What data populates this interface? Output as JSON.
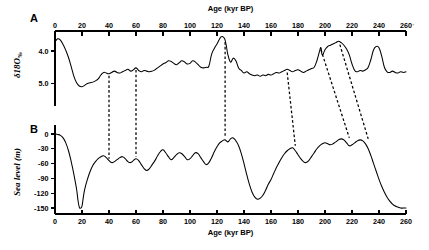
{
  "figure": {
    "panels": [
      {
        "id": "A",
        "label": "A"
      },
      {
        "id": "B",
        "label": "B"
      }
    ]
  },
  "chart_data": [
    {
      "type": "line",
      "panel": "A",
      "title": "",
      "xlabel": "Age (kyr BP)",
      "ylabel": "δ18O‰",
      "ylabel_main": "δ18O",
      "ylabel_unit": "‰",
      "xlim": [
        0,
        260
      ],
      "ylim": [
        5.45,
        3.35
      ],
      "y_inverted": true,
      "grid": false,
      "legend": "none",
      "axis_position": "top",
      "xticks": [
        0,
        20,
        40,
        60,
        80,
        100,
        120,
        140,
        160,
        180,
        200,
        220,
        240,
        260
      ],
      "xticklabels": [
        "0",
        "20",
        "40",
        "60",
        "80",
        "100",
        "120",
        "140",
        "160",
        "180",
        "200",
        "220",
        "240",
        "260"
      ],
      "yticks": [
        4.0,
        5.0
      ],
      "yticklabels": [
        "4.0",
        "5.0"
      ],
      "series": [
        {
          "name": "δ18O benthic record",
          "x": [
            0,
            2,
            4,
            6,
            8,
            10,
            12,
            14,
            16,
            18,
            20,
            22,
            24,
            26,
            28,
            30,
            32,
            34,
            36,
            38,
            40,
            42,
            44,
            46,
            48,
            50,
            52,
            54,
            56,
            58,
            60,
            62,
            64,
            66,
            68,
            70,
            72,
            74,
            76,
            78,
            80,
            82,
            84,
            86,
            88,
            90,
            92,
            94,
            96,
            98,
            100,
            102,
            104,
            106,
            108,
            110,
            112,
            114,
            116,
            118,
            120,
            121,
            122,
            123,
            124,
            125,
            126,
            127,
            128,
            130,
            132,
            134,
            136,
            138,
            140,
            142,
            144,
            146,
            148,
            150,
            152,
            154,
            156,
            158,
            160,
            162,
            164,
            166,
            168,
            170,
            172,
            174,
            176,
            178,
            180,
            182,
            184,
            186,
            188,
            190,
            192,
            194,
            196,
            197,
            198,
            200,
            202,
            204,
            206,
            208,
            210,
            212,
            214,
            216,
            218,
            220,
            222,
            224,
            226,
            228,
            230,
            232,
            234,
            236,
            238,
            240,
            242,
            244,
            246,
            248,
            250,
            252,
            254,
            256,
            258,
            260
          ],
          "y": [
            3.72,
            3.62,
            3.66,
            3.8,
            3.98,
            4.2,
            4.48,
            4.78,
            4.98,
            5.08,
            5.1,
            5.06,
            5.0,
            4.98,
            4.96,
            4.92,
            4.86,
            4.74,
            4.66,
            4.68,
            4.7,
            4.66,
            4.62,
            4.66,
            4.68,
            4.64,
            4.6,
            4.56,
            4.62,
            4.58,
            4.52,
            4.6,
            4.64,
            4.6,
            4.62,
            4.64,
            4.62,
            4.58,
            4.52,
            4.46,
            4.4,
            4.36,
            4.3,
            4.32,
            4.38,
            4.42,
            4.36,
            4.3,
            4.34,
            4.4,
            4.38,
            4.3,
            4.34,
            4.42,
            4.5,
            4.52,
            4.5,
            4.46,
            4.1,
            3.92,
            3.78,
            3.7,
            3.62,
            3.56,
            3.55,
            3.58,
            3.66,
            3.86,
            4.1,
            4.34,
            4.22,
            4.3,
            4.52,
            4.6,
            4.68,
            4.64,
            4.7,
            4.74,
            4.76,
            4.74,
            4.78,
            4.74,
            4.76,
            4.72,
            4.74,
            4.7,
            4.66,
            4.68,
            4.64,
            4.6,
            4.56,
            4.6,
            4.64,
            4.6,
            4.58,
            4.62,
            4.66,
            4.62,
            4.58,
            4.54,
            4.5,
            4.3,
            4.0,
            3.9,
            4.12,
            3.96,
            3.86,
            3.82,
            3.78,
            3.74,
            3.7,
            3.74,
            3.82,
            3.94,
            4.12,
            4.4,
            4.6,
            4.64,
            4.6,
            4.62,
            4.58,
            4.5,
            4.26,
            3.96,
            3.86,
            3.9,
            4.16,
            4.5,
            4.64,
            4.66,
            4.62,
            4.66,
            4.68,
            4.64,
            4.66,
            4.64
          ],
          "color": "#000000"
        }
      ]
    },
    {
      "type": "line",
      "panel": "B",
      "title": "",
      "xlabel": "Age (kyr BP)",
      "ylabel": "Sea level (m)",
      "xlim": [
        0,
        260
      ],
      "ylim": [
        -158,
        8
      ],
      "y_inverted": false,
      "grid": false,
      "legend": "none",
      "axis_position": "bottom",
      "xticks": [
        0,
        20,
        40,
        60,
        80,
        100,
        120,
        140,
        160,
        180,
        200,
        220,
        240,
        260
      ],
      "xticklabels": [
        "0",
        "20",
        "40",
        "60",
        "80",
        "100",
        "120",
        "140",
        "160",
        "180",
        "200",
        "220",
        "240",
        "260"
      ],
      "yticks": [
        0,
        -30,
        -60,
        -90,
        -120,
        -150
      ],
      "yticklabels": [
        "0",
        "-30",
        "-60",
        "-90",
        "-120",
        "-150"
      ],
      "series": [
        {
          "name": "Sea level reconstruction",
          "x": [
            0,
            2,
            4,
            6,
            8,
            10,
            12,
            14,
            16,
            17,
            18,
            19,
            20,
            21,
            22,
            24,
            26,
            28,
            30,
            32,
            34,
            36,
            38,
            40,
            42,
            44,
            46,
            48,
            50,
            52,
            54,
            56,
            58,
            60,
            62,
            64,
            66,
            68,
            70,
            72,
            74,
            76,
            78,
            80,
            82,
            84,
            86,
            88,
            90,
            92,
            94,
            96,
            98,
            100,
            102,
            104,
            106,
            108,
            110,
            112,
            114,
            116,
            118,
            120,
            122,
            124,
            126,
            128,
            130,
            132,
            134,
            136,
            138,
            140,
            142,
            144,
            146,
            148,
            150,
            152,
            154,
            156,
            158,
            160,
            162,
            164,
            166,
            168,
            170,
            172,
            174,
            176,
            178,
            180,
            182,
            184,
            186,
            188,
            190,
            192,
            194,
            196,
            198,
            200,
            202,
            204,
            206,
            208,
            210,
            212,
            214,
            216,
            218,
            220,
            222,
            224,
            226,
            228,
            230,
            232,
            234,
            236,
            238,
            240,
            242,
            244,
            246,
            248,
            250,
            252,
            254,
            256,
            258,
            260
          ],
          "y": [
            0,
            -1,
            -3,
            -8,
            -18,
            -34,
            -56,
            -82,
            -112,
            -134,
            -148,
            -150,
            -146,
            -128,
            -112,
            -92,
            -76,
            -64,
            -56,
            -50,
            -46,
            -44,
            -48,
            -54,
            -58,
            -56,
            -52,
            -48,
            -46,
            -50,
            -56,
            -58,
            -54,
            -50,
            -54,
            -62,
            -70,
            -74,
            -70,
            -62,
            -54,
            -44,
            -36,
            -32,
            -38,
            -46,
            -52,
            -48,
            -42,
            -38,
            -40,
            -46,
            -52,
            -50,
            -44,
            -38,
            -40,
            -48,
            -56,
            -62,
            -58,
            -48,
            -36,
            -26,
            -18,
            -14,
            -12,
            -16,
            -10,
            -8,
            -14,
            -24,
            -40,
            -60,
            -82,
            -102,
            -118,
            -128,
            -132,
            -130,
            -124,
            -114,
            -102,
            -92,
            -80,
            -68,
            -58,
            -48,
            -40,
            -34,
            -30,
            -28,
            -34,
            -42,
            -50,
            -56,
            -58,
            -54,
            -46,
            -38,
            -30,
            -24,
            -20,
            -18,
            -20,
            -22,
            -20,
            -16,
            -12,
            -10,
            -12,
            -18,
            -24,
            -22,
            -18,
            -14,
            -12,
            -14,
            -20,
            -30,
            -44,
            -60,
            -76,
            -92,
            -106,
            -118,
            -128,
            -136,
            -142,
            -146,
            -148,
            -150,
            -150,
            -150
          ],
          "color": "#000000"
        }
      ]
    }
  ],
  "correlation_lines": [
    {
      "name": "tie-line-40kyr",
      "top_age": 40,
      "top_value": 4.7,
      "bottom_age": 40,
      "bottom_value": -54,
      "style": "dashed"
    },
    {
      "name": "tie-line-60kyr",
      "top_age": 60,
      "top_value": 4.52,
      "bottom_age": 60,
      "bottom_value": -50,
      "style": "dashed"
    },
    {
      "name": "tie-line-125kyr",
      "top_age": 126,
      "top_value": 3.66,
      "bottom_age": 126,
      "bottom_value": -12,
      "style": "dashed"
    },
    {
      "name": "tie-line-175kyr",
      "top_age": 172,
      "top_value": 4.6,
      "bottom_age": 178,
      "bottom_value": -28,
      "style": "dashed"
    },
    {
      "name": "tie-line-197kyr",
      "top_age": 197,
      "top_value": 3.9,
      "bottom_age": 218,
      "bottom_value": -12,
      "style": "dashed"
    },
    {
      "name": "tie-line-210kyr",
      "top_age": 211,
      "top_value": 3.74,
      "bottom_age": 232,
      "bottom_value": -14,
      "style": "dashed"
    }
  ]
}
